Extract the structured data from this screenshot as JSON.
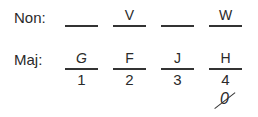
{
  "rows": {
    "non": {
      "label": "Non:",
      "slots": [
        "",
        "V",
        "",
        "W"
      ]
    },
    "maj": {
      "label": "Maj:",
      "slots": [
        "G",
        "F",
        "J",
        "H"
      ],
      "numbers": [
        "1",
        "2",
        "3",
        "4"
      ],
      "below_4": "0"
    }
  }
}
